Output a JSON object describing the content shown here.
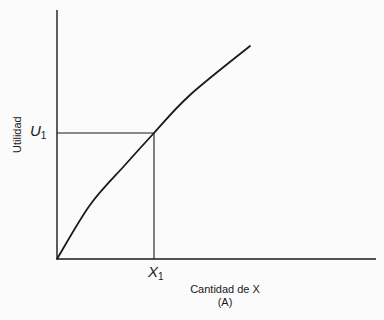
{
  "chart_data": {
    "type": "line",
    "title": "",
    "caption": "(A)",
    "xlabel": "Cantidad de X",
    "ylabel": "Utilidad",
    "x_tick_labels": [
      {
        "base": "X",
        "sub": "1"
      }
    ],
    "y_tick_labels": [
      {
        "base": "U",
        "sub": "1"
      }
    ],
    "grid": false,
    "legend": null,
    "axis": {
      "origin_px": [
        57,
        259
      ],
      "x_end_px": 376,
      "y_top_px": 10
    },
    "series": [
      {
        "name": "Total utility curve (concave)",
        "points_px": [
          [
            57,
            259
          ],
          [
            90,
            205
          ],
          [
            125,
            165
          ],
          [
            154,
            133
          ],
          [
            190,
            95
          ],
          [
            250,
            46
          ]
        ]
      }
    ],
    "reference_point": {
      "label_x": "X1",
      "label_y": "U1",
      "px": [
        154,
        133
      ],
      "drop_lines": true
    }
  },
  "labels": {
    "y_axis": "Utilidad",
    "x_axis": "Cantidad de X",
    "caption": "(A)",
    "u1_base": "U",
    "u1_sub": "1",
    "x1_base": "X",
    "x1_sub": "1"
  },
  "colors": {
    "ink": "#1a1a1a",
    "background": "#fbfbfb"
  }
}
